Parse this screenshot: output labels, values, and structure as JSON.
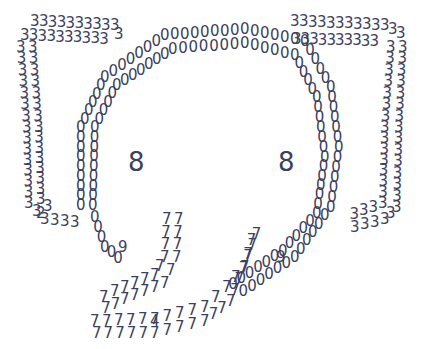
{
  "art": {
    "subject": "elephant face made of digits",
    "ink_color": "#3c3f5e",
    "background": "#ffffff",
    "eyes": {
      "left": "8",
      "right": "8"
    },
    "ear_digit": "3",
    "head_digit": "0",
    "trunk_digit": "7",
    "accent_digits": [
      "2",
      "9",
      "4"
    ]
  }
}
